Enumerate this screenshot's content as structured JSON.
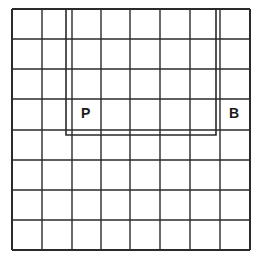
{
  "grid": {
    "rows": 8,
    "cols": 8,
    "x_lines": [
      12,
      42,
      72,
      101,
      130,
      160,
      190,
      220,
      250
    ],
    "y_lines": [
      9,
      39,
      69,
      99,
      130,
      160,
      190,
      220,
      250
    ],
    "line_color": "#2a2a2a",
    "outer_stroke": 2,
    "inner_stroke": 1.4
  },
  "inner_rect": {
    "left": 66,
    "right": 216,
    "top": 9,
    "bottom": 135,
    "color": "#2a2a2a"
  },
  "labels": [
    {
      "text": "P",
      "x": 81,
      "y": 106
    },
    {
      "text": "B",
      "x": 229,
      "y": 106
    }
  ]
}
